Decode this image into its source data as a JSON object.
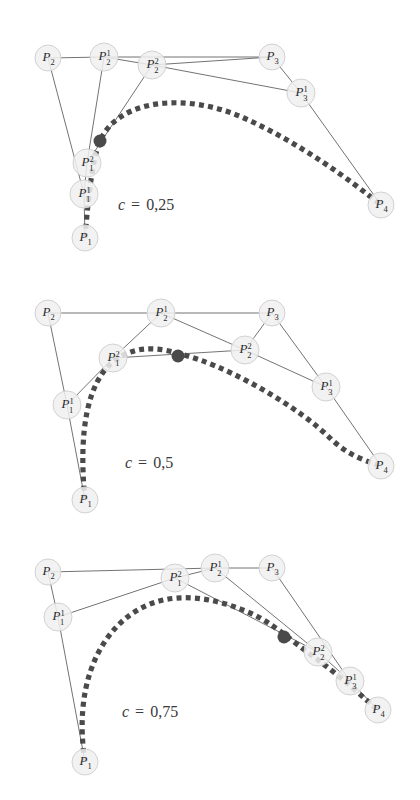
{
  "figure": {
    "background_color": "#ffffff",
    "node_fill_color": "#f0f0f0",
    "node_stroke_color": "#d2d2d2",
    "curve_color": "#4a4a4a",
    "line_color": "#5a5a5a"
  },
  "panels": [
    {
      "id": "panel-c-025",
      "caption": "c = 0,25",
      "caption_symbol": "c",
      "caption_eq": "=",
      "caption_value": "0,25",
      "caption_pos": {
        "x": 118,
        "y": 210
      },
      "nodes": [
        {
          "name": "P2",
          "base": "P",
          "sup": "",
          "sub": "2",
          "x": 48,
          "y": 58,
          "r": 13
        },
        {
          "name": "P2^1",
          "base": "P",
          "sup": "1",
          "sub": "2",
          "x": 104,
          "y": 57,
          "r": 14
        },
        {
          "name": "P2^2",
          "base": "P",
          "sup": "2",
          "sub": "2",
          "x": 152,
          "y": 65,
          "r": 14
        },
        {
          "name": "P3",
          "base": "P",
          "sup": "",
          "sub": "3",
          "x": 272,
          "y": 57,
          "r": 13
        },
        {
          "name": "P3^1",
          "base": "P",
          "sup": "1",
          "sub": "3",
          "x": 301,
          "y": 93,
          "r": 14
        },
        {
          "name": "P4",
          "base": "P",
          "sup": "",
          "sub": "4",
          "x": 381,
          "y": 205,
          "r": 13
        },
        {
          "name": "P1^2",
          "base": "P",
          "sup": "2",
          "sub": "1",
          "x": 87,
          "y": 163,
          "r": 14
        },
        {
          "name": "P1^1",
          "base": "P",
          "sup": "1",
          "sub": "1",
          "x": 84,
          "y": 194,
          "r": 14
        },
        {
          "name": "P1",
          "base": "P",
          "sup": "",
          "sub": "1",
          "x": 85,
          "y": 238,
          "r": 13
        }
      ],
      "segments": [
        [
          "P2",
          "P2^1"
        ],
        [
          "P2^1",
          "P2^2"
        ],
        [
          "P2^2",
          "P3"
        ],
        [
          "P2^1",
          "P3"
        ],
        [
          "P3",
          "P3^1"
        ],
        [
          "P3^1",
          "P4"
        ],
        [
          "P2",
          "P1^1"
        ],
        [
          "P2^1",
          "P1^2"
        ],
        [
          "P2^2",
          "P1^2"
        ],
        [
          "P1^2",
          "P1^1"
        ],
        [
          "P1^1",
          "P1"
        ],
        [
          "P2^2",
          "P3^1"
        ]
      ],
      "marker": {
        "name": "split-point",
        "x": 100,
        "y": 141,
        "r": 6.5
      },
      "curve": "M 85 238 C 88 200 92 160 100 141 C 118 99 186 92 244 118 C 300 143 350 180 381 205"
    },
    {
      "id": "panel-c-05",
      "caption": "c = 0,5",
      "caption_symbol": "c",
      "caption_eq": "=",
      "caption_value": "0,5",
      "caption_pos": {
        "x": 125,
        "y": 468
      },
      "nodes": [
        {
          "name": "P2",
          "base": "P",
          "sup": "",
          "sub": "2",
          "x": 48,
          "y": 313,
          "r": 13
        },
        {
          "name": "P2^1",
          "base": "P",
          "sup": "1",
          "sub": "2",
          "x": 161,
          "y": 313,
          "r": 14
        },
        {
          "name": "P3",
          "base": "P",
          "sup": "",
          "sub": "3",
          "x": 272,
          "y": 313,
          "r": 13
        },
        {
          "name": "P2^2",
          "base": "P",
          "sup": "2",
          "sub": "2",
          "x": 245,
          "y": 350,
          "r": 14
        },
        {
          "name": "P3^1",
          "base": "P",
          "sup": "1",
          "sub": "3",
          "x": 326,
          "y": 387,
          "r": 14
        },
        {
          "name": "P4",
          "base": "P",
          "sup": "",
          "sub": "4",
          "x": 381,
          "y": 466,
          "r": 13
        },
        {
          "name": "P1^2",
          "base": "P",
          "sup": "2",
          "sub": "1",
          "x": 113,
          "y": 358,
          "r": 14
        },
        {
          "name": "P1^1",
          "base": "P",
          "sup": "1",
          "sub": "1",
          "x": 67,
          "y": 405,
          "r": 14
        },
        {
          "name": "P1",
          "base": "P",
          "sup": "",
          "sub": "1",
          "x": 85,
          "y": 500,
          "r": 13
        }
      ],
      "segments": [
        [
          "P2",
          "P2^1"
        ],
        [
          "P2^1",
          "P3"
        ],
        [
          "P2^1",
          "P2^2"
        ],
        [
          "P2^2",
          "P3"
        ],
        [
          "P3",
          "P3^1"
        ],
        [
          "P3^1",
          "P4"
        ],
        [
          "P2",
          "P1^1"
        ],
        [
          "P2^1",
          "P1^2"
        ],
        [
          "P1^2",
          "P1^1"
        ],
        [
          "P1^1",
          "P1"
        ],
        [
          "P1^2",
          "P2^2"
        ],
        [
          "P2^2",
          "P3^1"
        ]
      ],
      "marker": {
        "name": "split-point",
        "x": 178,
        "y": 356,
        "r": 6.5
      },
      "curve": "M 85 500 C 78 430 88 382 113 362 C 140 340 170 350 200 360 C 240 374 300 408 332 440 C 352 458 370 462 381 466"
    },
    {
      "id": "panel-c-075",
      "caption": "c = 0,75",
      "caption_symbol": "c",
      "caption_eq": "=",
      "caption_value": "0,75",
      "caption_pos": {
        "x": 122,
        "y": 717
      },
      "nodes": [
        {
          "name": "P2",
          "base": "P",
          "sup": "",
          "sub": "2",
          "x": 48,
          "y": 572,
          "r": 13
        },
        {
          "name": "P1^2",
          "base": "P",
          "sup": "2",
          "sub": "1",
          "x": 175,
          "y": 578,
          "r": 14
        },
        {
          "name": "P2^1",
          "base": "P",
          "sup": "1",
          "sub": "2",
          "x": 215,
          "y": 568,
          "r": 14
        },
        {
          "name": "P3",
          "base": "P",
          "sup": "",
          "sub": "3",
          "x": 272,
          "y": 568,
          "r": 13
        },
        {
          "name": "P1^1",
          "base": "P",
          "sup": "1",
          "sub": "1",
          "x": 58,
          "y": 617,
          "r": 14
        },
        {
          "name": "P2^2",
          "base": "P",
          "sup": "2",
          "sub": "2",
          "x": 318,
          "y": 652,
          "r": 14
        },
        {
          "name": "P3^1",
          "base": "P",
          "sup": "1",
          "sub": "3",
          "x": 350,
          "y": 681,
          "r": 14
        },
        {
          "name": "P4",
          "base": "P",
          "sup": "",
          "sub": "4",
          "x": 378,
          "y": 710,
          "r": 13
        },
        {
          "name": "P1",
          "base": "P",
          "sup": "",
          "sub": "1",
          "x": 85,
          "y": 762,
          "r": 13
        }
      ],
      "segments": [
        [
          "P2",
          "P2^1"
        ],
        [
          "P2^1",
          "P3"
        ],
        [
          "P2",
          "P1^1"
        ],
        [
          "P1^1",
          "P1^2"
        ],
        [
          "P1^2",
          "P2^1"
        ],
        [
          "P1^2",
          "P2^2"
        ],
        [
          "P2^1",
          "P2^2"
        ],
        [
          "P3",
          "P3^1"
        ],
        [
          "P2^2",
          "P3^1"
        ],
        [
          "P3^1",
          "P4"
        ],
        [
          "P1^1",
          "P1"
        ]
      ],
      "marker": {
        "name": "split-point",
        "x": 284,
        "y": 637,
        "r": 6.5
      },
      "curve": "M 85 762 C 74 690 96 640 130 615 C 166 589 210 596 248 612 C 272 622 290 640 318 660 C 340 676 366 700 378 710"
    }
  ]
}
